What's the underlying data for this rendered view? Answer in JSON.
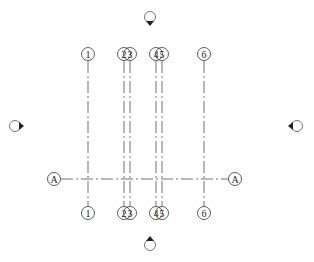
{
  "view": {
    "background": "#ffffff",
    "line_color": "#333333",
    "elevation_marker_color": "#222222"
  },
  "grids_vertical": [
    {
      "label": "1",
      "x": 88
    },
    {
      "label": "2",
      "x": 124
    },
    {
      "label": "3",
      "x": 130
    },
    {
      "label": "4",
      "x": 156
    },
    {
      "label": "5",
      "x": 162
    },
    {
      "label": "6",
      "x": 204
    }
  ],
  "grids_horizontal": [
    {
      "label": "A",
      "y": 179
    }
  ],
  "grid_extents": {
    "top_bubble_y": 54,
    "bottom_bubble_y": 213,
    "line_top_y": 61,
    "line_bottom_y": 206,
    "h_left_x": 61,
    "h_right_x": 228,
    "h_left_bubble_x": 54,
    "h_right_bubble_x": 235
  },
  "elevation_markers": [
    {
      "name": "north",
      "x": 150,
      "y": 17,
      "direction": "down"
    },
    {
      "name": "south",
      "x": 150,
      "y": 245,
      "direction": "up"
    },
    {
      "name": "west",
      "x": 15,
      "y": 126,
      "direction": "right"
    },
    {
      "name": "east",
      "x": 297,
      "y": 126,
      "direction": "left"
    }
  ]
}
